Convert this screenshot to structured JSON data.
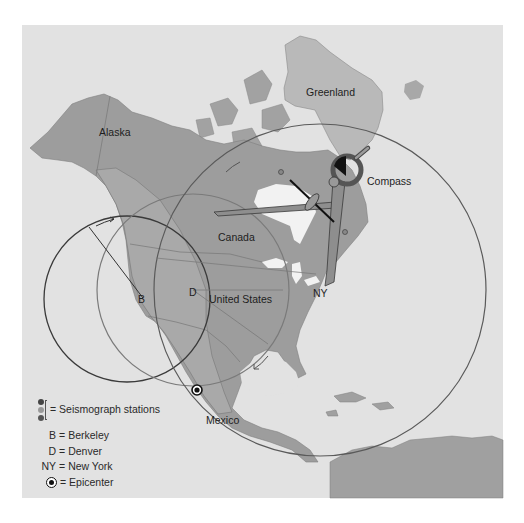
{
  "figure": {
    "map_labels": {
      "greenland": "Greenland",
      "alaska": "Alaska",
      "canada": "Canada",
      "united_states": "United States",
      "mexico": "Mexico",
      "compass": "Compass"
    },
    "station_markers": {
      "berkeley": "B",
      "denver": "D",
      "new_york": "NY"
    },
    "legend": {
      "stations": "= Seismograph stations",
      "items": [
        {
          "key": "B",
          "eq": "=",
          "label": "Berkeley"
        },
        {
          "key": "D",
          "eq": "=",
          "label": "Denver"
        },
        {
          "key": "NY",
          "eq": "=",
          "label": "New York"
        }
      ],
      "epicenter": "= Epicenter"
    },
    "circles": [
      {
        "station": "Berkeley",
        "color": "#3a3a3a"
      },
      {
        "station": "Denver",
        "color": "#7a7a7a"
      },
      {
        "station": "New York",
        "color": "#5a5a5a"
      }
    ],
    "colors": {
      "ocean": "#e3e3e3",
      "land": "#9c9c9c",
      "land_dark": "#8a8a8a",
      "greenland": "#b8b8b8",
      "water_inland": "#f0f0f0",
      "compass": "#8e8e8e"
    }
  }
}
